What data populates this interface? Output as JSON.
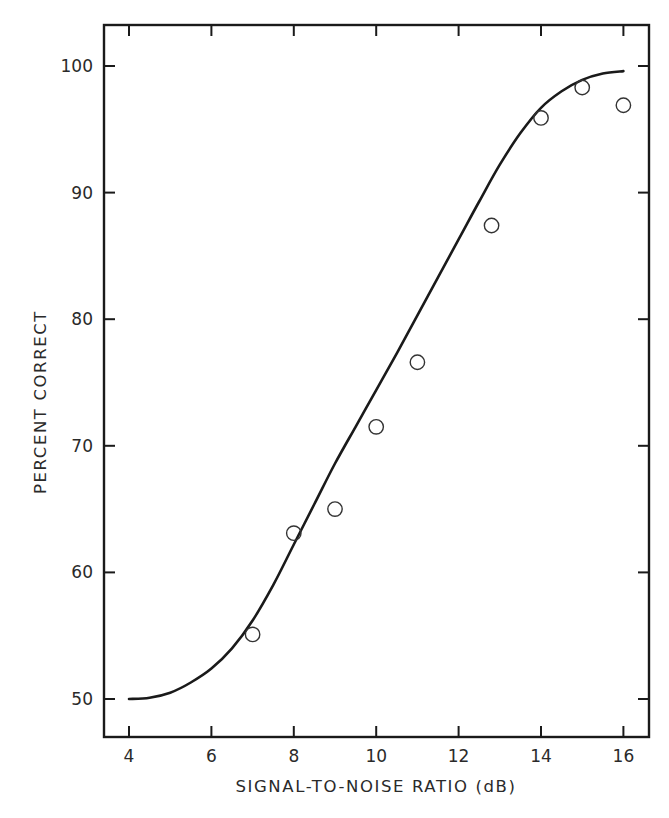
{
  "chart_data": {
    "type": "line",
    "title": "",
    "xlabel": "SIGNAL-TO-NOISE RATIO (dB)",
    "ylabel": "PERCENT CORRECT",
    "xlim": [
      3.4,
      16.6
    ],
    "ylim": [
      47,
      103
    ],
    "x_ticks": [
      4,
      6,
      8,
      10,
      12,
      14,
      16
    ],
    "x_tick_labels": [
      "4",
      "6",
      "8",
      "10",
      "12",
      "14",
      "16"
    ],
    "y_ticks": [
      50,
      60,
      70,
      80,
      90,
      100
    ],
    "y_tick_labels": [
      "50",
      "60",
      "70",
      "80",
      "90",
      "100"
    ],
    "grid": false,
    "legend": null,
    "series": [
      {
        "name": "observed",
        "style": "open-circle markers",
        "x": [
          7,
          8,
          9,
          10,
          11,
          12.8,
          14,
          15,
          16
        ],
        "y": [
          55.1,
          63.1,
          65.0,
          71.5,
          76.6,
          87.4,
          95.9,
          98.3,
          96.9
        ]
      },
      {
        "name": "fitted curve",
        "style": "solid line",
        "x": [
          4.0,
          4.5,
          5.0,
          5.5,
          6.0,
          6.5,
          7.0,
          7.5,
          8.0,
          8.5,
          9.0,
          9.5,
          10.0,
          10.5,
          11.0,
          11.5,
          12.0,
          12.5,
          13.0,
          13.5,
          14.0,
          14.5,
          15.0,
          15.5,
          16.0
        ],
        "y": [
          50.0,
          50.1,
          50.5,
          51.3,
          52.4,
          54.0,
          56.2,
          59.0,
          62.2,
          65.4,
          68.6,
          71.5,
          74.4,
          77.3,
          80.3,
          83.3,
          86.3,
          89.3,
          92.2,
          94.7,
          96.7,
          98.0,
          98.9,
          99.4,
          99.6
        ]
      }
    ]
  }
}
